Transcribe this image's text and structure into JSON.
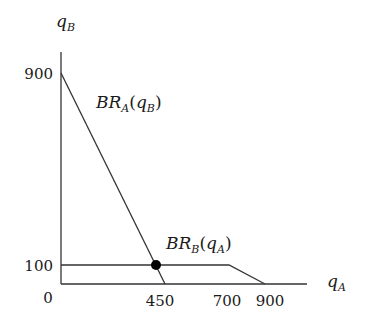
{
  "diagram": {
    "type": "best-response-diagram",
    "axes": {
      "x": {
        "variable": "q",
        "subscript": "A"
      },
      "y": {
        "variable": "q",
        "subscript": "B"
      },
      "origin_label": "0"
    },
    "y_ticks": [
      {
        "label": "900",
        "value": 900
      },
      {
        "label": "100",
        "value": 100
      }
    ],
    "x_ticks": [
      {
        "label": "450",
        "value": 450
      },
      {
        "label": "700",
        "value": 700
      },
      {
        "label": "900",
        "value": 900
      }
    ],
    "curves": [
      {
        "name": "BR_A(q_B)",
        "label_main": "BR",
        "label_sub": "A",
        "label_arg_open": "(",
        "label_arg_var": "q",
        "label_arg_sub": "B",
        "label_arg_close": ")",
        "points": [
          [
            0,
            900
          ],
          [
            450,
            0
          ]
        ]
      },
      {
        "name": "BR_B(q_A)",
        "label_main": "BR",
        "label_sub": "B",
        "label_arg_open": "(",
        "label_arg_var": "q",
        "label_arg_sub": "A",
        "label_arg_close": ")",
        "points": [
          [
            0,
            100
          ],
          [
            700,
            100
          ],
          [
            900,
            0
          ]
        ]
      }
    ],
    "equilibrium": {
      "q_A": 400,
      "q_B": 100
    },
    "colors": {
      "line": "#333333",
      "dot": "#000000",
      "text": "#1a1a1a"
    }
  }
}
